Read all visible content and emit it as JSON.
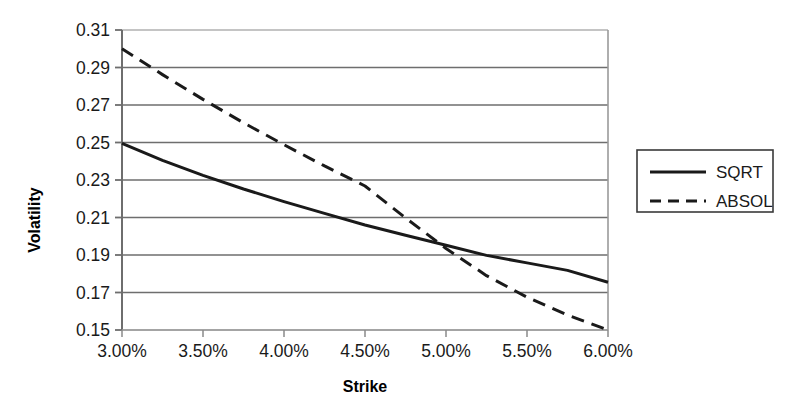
{
  "chart_data": {
    "type": "line",
    "title": "",
    "xlabel": "Strike",
    "ylabel": "Volatility",
    "xlim": [
      3.0,
      6.0
    ],
    "ylim": [
      0.15,
      0.31
    ],
    "grid": "horizontal",
    "legend_position": "right-outside",
    "x_tick_labels": [
      "3.00%",
      "3.50%",
      "4.00%",
      "4.50%",
      "5.00%",
      "5.50%",
      "6.00%"
    ],
    "x_tick_values": [
      3.0,
      3.5,
      4.0,
      4.5,
      5.0,
      5.5,
      6.0
    ],
    "y_tick_labels": [
      "0.31",
      "0.29",
      "0.27",
      "0.25",
      "0.23",
      "0.21",
      "0.19",
      "0.17",
      "0.15"
    ],
    "y_tick_values": [
      0.31,
      0.29,
      0.27,
      0.25,
      0.23,
      0.21,
      0.19,
      0.17,
      0.15
    ],
    "x": [
      3.0,
      3.25,
      3.5,
      3.75,
      4.0,
      4.25,
      4.5,
      4.75,
      5.0,
      5.25,
      5.5,
      5.75,
      6.0
    ],
    "series": [
      {
        "name": "SQRT",
        "style": "solid",
        "color": "#1a1a1a",
        "values": [
          0.2495,
          0.2405,
          0.2325,
          0.2252,
          0.2185,
          0.2122,
          0.206,
          0.2005,
          0.1952,
          0.1898,
          0.1858,
          0.1818,
          0.1755
        ]
      },
      {
        "name": "ABSOL",
        "style": "dashed",
        "color": "#1a1a1a",
        "values": [
          0.3,
          0.2862,
          0.273,
          0.2605,
          0.2488,
          0.2375,
          0.2268,
          0.2098,
          0.1935,
          0.179,
          0.1675,
          0.158,
          0.15
        ]
      }
    ],
    "annotations": [
      {
        "label": "curve-crossing",
        "x": 4.35,
        "y": 0.2095
      }
    ]
  },
  "legend": {
    "items": [
      {
        "label": "SQRT",
        "style": "solid"
      },
      {
        "label": "ABSOL",
        "style": "dashed"
      }
    ]
  },
  "axes": {
    "y_title": "Volatility",
    "x_title": "Strike"
  }
}
